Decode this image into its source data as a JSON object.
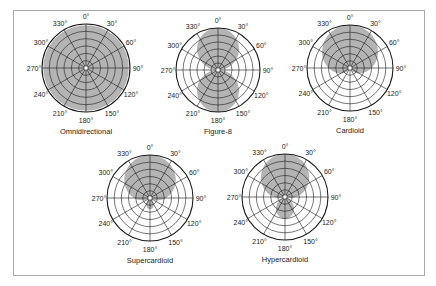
{
  "figure": {
    "colors": {
      "fill": "#b4b4b4",
      "grid": "#1a1a1a",
      "border": "#a8a8a8",
      "background": "#ffffff"
    },
    "angle_labels": [
      "0°",
      "30°",
      "60°",
      "90°",
      "120°",
      "150°",
      "180°",
      "210°",
      "240°",
      "270°",
      "300°",
      "330°"
    ],
    "rings": 6
  },
  "chart_data": [
    {
      "type": "polar",
      "title": "Omnidirectional",
      "pattern": "omnidirectional",
      "center": [
        86,
        68
      ],
      "radius": 44
    },
    {
      "type": "polar",
      "title": "Figure-8",
      "pattern": "figure8",
      "center": [
        218,
        70
      ],
      "radius": 42
    },
    {
      "type": "polar",
      "title": "Cardioid",
      "pattern": "cardioid",
      "center": [
        350,
        68
      ],
      "radius": 43
    },
    {
      "type": "polar",
      "title": "Supercardioid",
      "pattern": "supercardioid",
      "center": [
        150,
        198
      ],
      "radius": 43
    },
    {
      "type": "polar",
      "title": "Hypercardioid",
      "pattern": "hypercardioid",
      "center": [
        285,
        197
      ],
      "radius": 43
    }
  ]
}
